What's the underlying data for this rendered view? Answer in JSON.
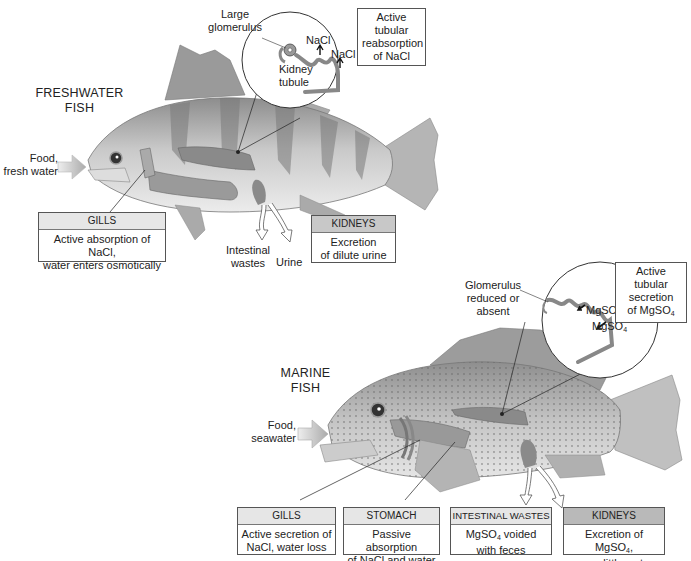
{
  "freshwater": {
    "title_line1": "FRESHWATER",
    "title_line2": "FISH",
    "food_label_line1": "Food,",
    "food_label_line2": "fresh water",
    "inset": {
      "glomerulus_line1": "Large",
      "glomerulus_line2": "glomerulus",
      "nacl_1": "NaCl",
      "nacl_2": "NaCl",
      "tubule_line1": "Kidney",
      "tubule_line2": "tubule",
      "callout_line1": "Active tubular",
      "callout_line2": "reabsorption",
      "callout_line3": "of NaCl"
    },
    "gills_box": {
      "header": "GILLS",
      "line1": "Active absorption of NaCl,",
      "line2": "water enters osmotically"
    },
    "kidneys_box": {
      "header": "KIDNEYS",
      "line1": "Excretion",
      "line2": "of dilute urine"
    },
    "intestinal_line1": "Intestinal",
    "intestinal_line2": "wastes",
    "urine": "Urine"
  },
  "marine": {
    "title_line1": "MARINE",
    "title_line2": "FISH",
    "food_label_line1": "Food,",
    "food_label_line2": "seawater",
    "inset": {
      "glomerulus_line1": "Glomerulus",
      "glomerulus_line2": "reduced or",
      "glomerulus_line3": "absent",
      "mgso4_1": "MgSO",
      "mgso4_2": "MgSO",
      "sub4": "4",
      "callout_line1": "Active tubular",
      "callout_line2": "secretion",
      "callout_line3": "of MgSO"
    },
    "gills_box": {
      "header": "GILLS",
      "line1": "Active secretion of",
      "line2": "NaCl, water loss"
    },
    "stomach_box": {
      "header": "STOMACH",
      "line1": "Passive absorption",
      "line2": "of NaCl and water"
    },
    "intestinal_box": {
      "header": "INTESTINAL WASTES",
      "line1a": "MgSO",
      "line1b": " voided",
      "line2": "with feces"
    },
    "kidneys_box": {
      "header": "KIDNEYS",
      "line1a": "Excretion of MgSO",
      "line1b": ",",
      "line2": "urea, little water"
    }
  },
  "colors": {
    "header_light": "#e6e6e6",
    "header_dark": "#b9b9b9",
    "border": "#555555",
    "organ": "#8a8a8a"
  }
}
